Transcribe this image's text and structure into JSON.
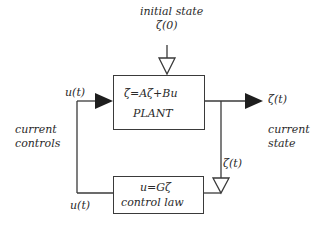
{
  "diagram": {
    "type": "feedback-control-block-diagram",
    "initial_state": {
      "label": "initial state",
      "symbol": "ζ(0)"
    },
    "plant": {
      "equation": "ζ̇=Aζ+Bu",
      "name": "PLANT"
    },
    "controller": {
      "equation": "u=Gζ",
      "name": "control law"
    },
    "output": {
      "symbol": "ζ(t)",
      "label_line1": "current",
      "label_line2": "state"
    },
    "feedback_signal": {
      "symbol": "ζ(t)"
    },
    "input": {
      "symbol": "u(t)",
      "label_line1": "current",
      "label_line2": "controls"
    },
    "controller_output": {
      "symbol": "u(t)"
    },
    "colors": {
      "line": "#3a3a3a",
      "text": "#2a2a2a",
      "background": "#ffffff"
    }
  }
}
